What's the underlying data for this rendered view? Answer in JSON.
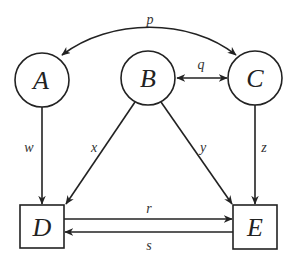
{
  "diagram": {
    "type": "directed-graph",
    "colors": {
      "stroke": "#222222",
      "background": "#ffffff"
    },
    "nodes": {
      "A": {
        "label": "A",
        "shape": "circle"
      },
      "B": {
        "label": "B",
        "shape": "circle"
      },
      "C": {
        "label": "C",
        "shape": "circle"
      },
      "D": {
        "label": "D",
        "shape": "square"
      },
      "E": {
        "label": "E",
        "shape": "square"
      }
    },
    "edges": {
      "p": {
        "label": "p",
        "from": "A",
        "to": "C",
        "direction": "bidirectional",
        "curved": true
      },
      "q": {
        "label": "q",
        "from": "B",
        "to": "C",
        "direction": "bidirectional"
      },
      "w": {
        "label": "w",
        "from": "A",
        "to": "D",
        "direction": "forward"
      },
      "x": {
        "label": "x",
        "from": "B",
        "to": "D",
        "direction": "forward"
      },
      "y": {
        "label": "y",
        "from": "B",
        "to": "E",
        "direction": "forward"
      },
      "z": {
        "label": "z",
        "from": "C",
        "to": "E",
        "direction": "forward"
      },
      "r": {
        "label": "r",
        "from": "D",
        "to": "E",
        "direction": "forward"
      },
      "s": {
        "label": "s",
        "from": "E",
        "to": "D",
        "direction": "forward"
      }
    }
  }
}
